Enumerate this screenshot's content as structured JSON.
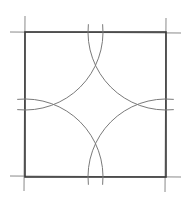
{
  "diagram": {
    "type": "geometric-construction",
    "colors": {
      "background": "#ffffff",
      "square_stroke": "#3a3a3a",
      "extension_stroke": "#8a8a8a",
      "arc_stroke": "#7a7a7a"
    },
    "square": {
      "x1": 25,
      "y1": 32,
      "x2": 166,
      "y2": 177
    },
    "extension_lines": [
      {
        "x1": 10,
        "y1": 32,
        "x2": 181,
        "y2": 33
      },
      {
        "x1": 10,
        "y1": 176,
        "x2": 181,
        "y2": 177
      },
      {
        "x1": 25,
        "y1": 16,
        "x2": 24,
        "y2": 191
      },
      {
        "x1": 166,
        "y1": 18,
        "x2": 165,
        "y2": 192
      }
    ],
    "arcs": [
      {
        "corner": "top-left",
        "cx": 25,
        "cy": 32,
        "r": 78
      },
      {
        "corner": "top-right",
        "cx": 166,
        "cy": 32,
        "r": 78
      },
      {
        "corner": "bottom-left",
        "cx": 25,
        "cy": 177,
        "r": 78
      },
      {
        "corner": "bottom-right",
        "cx": 166,
        "cy": 177,
        "r": 78
      }
    ]
  }
}
